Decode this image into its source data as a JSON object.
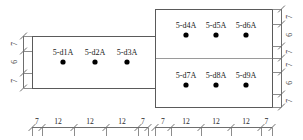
{
  "drawing": {
    "title": "reinforcement-layout-section",
    "units_note": "",
    "colors": {
      "outline": "#5a5a5a",
      "divider": "#9a9a9a",
      "dot": "#000000",
      "dimension_line": "#6e6e6e",
      "text": "#1a1a1a"
    }
  },
  "shapes": {
    "left_rect": {
      "x": 32,
      "y": 36,
      "w": 123,
      "h": 52
    },
    "right_rect": {
      "x": 155,
      "y": 9,
      "w": 117,
      "h": 98
    },
    "right_divider_y": 58
  },
  "bar_labels": {
    "left_row": [
      "5-d1A",
      "5-d2A",
      "5-d3A"
    ],
    "right_top_row": [
      "5-d4A",
      "5-d5A",
      "5-d6A"
    ],
    "right_bottom_row": [
      "5-d7A",
      "5-d8A",
      "5-d9A"
    ]
  },
  "bar_points": {
    "left_row": [
      {
        "x": 63,
        "y": 62
      },
      {
        "x": 95,
        "y": 62
      },
      {
        "x": 127,
        "y": 62
      }
    ],
    "right_top_row": [
      {
        "x": 186,
        "y": 35
      },
      {
        "x": 216,
        "y": 35
      },
      {
        "x": 246,
        "y": 35
      }
    ],
    "right_bottom_row": [
      {
        "x": 186,
        "y": 85
      },
      {
        "x": 216,
        "y": 85
      },
      {
        "x": 246,
        "y": 85
      }
    ]
  },
  "dimensions": {
    "bottom": {
      "label": "bottom-dimension-chain",
      "segments": [
        {
          "value": "7",
          "from": 32,
          "to": 42
        },
        {
          "value": "12",
          "from": 42,
          "to": 74
        },
        {
          "value": "12",
          "from": 74,
          "to": 106
        },
        {
          "value": "12",
          "from": 106,
          "to": 138
        },
        {
          "value": "7",
          "from": 138,
          "to": 148
        },
        {
          "value": "7",
          "from": 155,
          "to": 171
        },
        {
          "value": "12",
          "from": 171,
          "to": 201
        },
        {
          "value": "12",
          "from": 201,
          "to": 231
        },
        {
          "value": "12",
          "from": 231,
          "to": 261
        },
        {
          "value": "7",
          "from": 261,
          "to": 272
        }
      ]
    },
    "left": {
      "label": "left-dimension-chain",
      "segments": [
        {
          "value": "7",
          "from": 36,
          "to": 51
        },
        {
          "value": "6",
          "from": 51,
          "to": 73
        },
        {
          "value": "7",
          "from": 73,
          "to": 88
        }
      ]
    },
    "right": {
      "label": "right-dimension-chain",
      "segments": [
        {
          "value": "7",
          "from": 9,
          "to": 24
        },
        {
          "value": "6",
          "from": 24,
          "to": 46
        },
        {
          "value": "7",
          "from": 46,
          "to": 58
        },
        {
          "value": "7",
          "from": 58,
          "to": 72
        },
        {
          "value": "6",
          "from": 72,
          "to": 94
        },
        {
          "value": "7",
          "from": 94,
          "to": 107
        }
      ]
    }
  }
}
